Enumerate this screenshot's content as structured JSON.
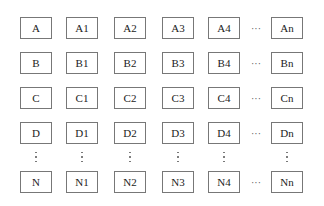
{
  "diagram": {
    "rows": [
      {
        "cells": [
          "A",
          "A1",
          "A2",
          "A3",
          "A4",
          "An"
        ]
      },
      {
        "cells": [
          "B",
          "B1",
          "B2",
          "B3",
          "B4",
          "Bn"
        ]
      },
      {
        "cells": [
          "C",
          "C1",
          "C2",
          "C3",
          "C4",
          "Cn"
        ]
      },
      {
        "cells": [
          "D",
          "D1",
          "D2",
          "D3",
          "D4",
          "Dn"
        ]
      },
      {
        "cells": [
          "N",
          "N1",
          "N2",
          "N3",
          "N4",
          "Nn"
        ]
      }
    ],
    "horizontal_ellipsis": "···",
    "vertical_ellipsis": "⋮"
  }
}
